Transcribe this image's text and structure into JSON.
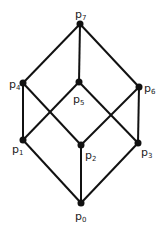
{
  "diagram": {
    "type": "hasse-diagram",
    "nodes": [
      {
        "id": "p0",
        "base": "p",
        "sub": "0",
        "x": 81,
        "y": 203,
        "lx": 75,
        "ly": 220
      },
      {
        "id": "p1",
        "base": "p",
        "sub": "1",
        "x": 23,
        "y": 140,
        "lx": 12,
        "ly": 153
      },
      {
        "id": "p2",
        "base": "p",
        "sub": "2",
        "x": 81,
        "y": 145,
        "lx": 85,
        "ly": 159
      },
      {
        "id": "p3",
        "base": "p",
        "sub": "3",
        "x": 138,
        "y": 143,
        "lx": 141,
        "ly": 156
      },
      {
        "id": "p4",
        "base": "p",
        "sub": "4",
        "x": 23,
        "y": 83,
        "lx": 9,
        "ly": 88
      },
      {
        "id": "p5",
        "base": "p",
        "sub": "5",
        "x": 79,
        "y": 82,
        "lx": 73,
        "ly": 103
      },
      {
        "id": "p6",
        "base": "p",
        "sub": "6",
        "x": 139,
        "y": 87,
        "lx": 144,
        "ly": 92
      },
      {
        "id": "p7",
        "base": "p",
        "sub": "7",
        "x": 80,
        "y": 24,
        "lx": 75,
        "ly": 18
      }
    ],
    "edges": [
      [
        "p7",
        "p4"
      ],
      [
        "p7",
        "p5"
      ],
      [
        "p7",
        "p6"
      ],
      [
        "p4",
        "p1"
      ],
      [
        "p4",
        "p2"
      ],
      [
        "p5",
        "p1"
      ],
      [
        "p5",
        "p3"
      ],
      [
        "p6",
        "p2"
      ],
      [
        "p6",
        "p3"
      ],
      [
        "p1",
        "p0"
      ],
      [
        "p2",
        "p0"
      ],
      [
        "p3",
        "p0"
      ]
    ],
    "colors": {
      "edge": "#111111",
      "node": "#111111",
      "label": "#222222",
      "background": "#ffffff"
    }
  }
}
